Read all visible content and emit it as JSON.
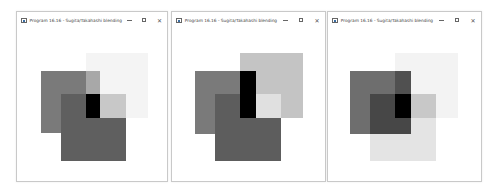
{
  "windows": [
    {
      "title": "Program 16.16 - Sugita/Takahashi blending",
      "controls": {
        "minimize": "—",
        "maximize": "☐",
        "close": "✕"
      },
      "frame": {
        "x": 16,
        "y": 11,
        "w": 152,
        "h": 171
      },
      "regions": [
        {
          "name": "square-a",
          "x": 41,
          "y": 71,
          "w": 59,
          "h": 62,
          "color": "#7a7a7a"
        },
        {
          "name": "square-b",
          "x": 86,
          "y": 53,
          "w": 62,
          "h": 65,
          "color": "#f4f4f4"
        },
        {
          "name": "overlap-a-b",
          "x": 86,
          "y": 71,
          "w": 14,
          "h": 23,
          "color": "#a8a8a8"
        },
        {
          "name": "square-c",
          "x": 61,
          "y": 94,
          "w": 65,
          "h": 67,
          "color": "#5f5f5f"
        },
        {
          "name": "overlap-b-c",
          "x": 100,
          "y": 94,
          "w": 26,
          "h": 24,
          "color": "#c8c8c8"
        },
        {
          "name": "overlap-a-b-c",
          "x": 86,
          "y": 94,
          "w": 14,
          "h": 24,
          "color": "#000000"
        }
      ]
    },
    {
      "title": "Program 16.16 - Sugita/Takahashi blending",
      "controls": {
        "minimize": "—",
        "maximize": "☐",
        "close": "✕"
      },
      "frame": {
        "x": 171,
        "y": 11,
        "w": 155,
        "h": 171
      },
      "regions": [
        {
          "name": "square-a",
          "x": 195,
          "y": 71,
          "w": 61,
          "h": 63,
          "color": "#7a7a7a"
        },
        {
          "name": "square-b",
          "x": 240,
          "y": 53,
          "w": 63,
          "h": 65,
          "color": "#c4c4c4"
        },
        {
          "name": "square-c",
          "x": 215,
          "y": 94,
          "w": 66,
          "h": 67,
          "color": "#5d5d5d"
        },
        {
          "name": "overlap-b-c",
          "x": 256,
          "y": 94,
          "w": 25,
          "h": 24,
          "color": "#e0e0e0"
        },
        {
          "name": "overlap-a-b",
          "x": 240,
          "y": 71,
          "w": 16,
          "h": 47,
          "color": "#000000"
        }
      ]
    },
    {
      "title": "Program 16.16 - Sugita/Takahashi blending",
      "controls": {
        "minimize": "—",
        "maximize": "☐",
        "close": "✕"
      },
      "frame": {
        "x": 327,
        "y": 11,
        "w": 155,
        "h": 171
      },
      "regions": [
        {
          "name": "square-b",
          "x": 395,
          "y": 53,
          "w": 63,
          "h": 65,
          "color": "#f3f3f3"
        },
        {
          "name": "square-c",
          "x": 370,
          "y": 94,
          "w": 66,
          "h": 67,
          "color": "#e4e4e4"
        },
        {
          "name": "overlap-b-c",
          "x": 395,
          "y": 94,
          "w": 41,
          "h": 24,
          "color": "#c8c8c8"
        },
        {
          "name": "square-a",
          "x": 350,
          "y": 71,
          "w": 61,
          "h": 63,
          "color": "#6e6e6e"
        },
        {
          "name": "overlap-a-b",
          "x": 395,
          "y": 71,
          "w": 16,
          "h": 23,
          "color": "#505050"
        },
        {
          "name": "overlap-a-c",
          "x": 370,
          "y": 94,
          "w": 41,
          "h": 40,
          "color": "#474747"
        },
        {
          "name": "overlap-a-b-c",
          "x": 395,
          "y": 94,
          "w": 16,
          "h": 24,
          "color": "#000000"
        }
      ]
    }
  ]
}
